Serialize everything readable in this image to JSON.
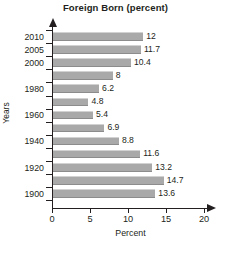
{
  "chart_data": {
    "type": "bar",
    "orientation": "horizontal",
    "title": "Foreign Born (percent)",
    "xlabel": "Percent",
    "ylabel": "Years",
    "xlim": [
      0,
      20
    ],
    "xticks": [
      0,
      5,
      10,
      15,
      20
    ],
    "xtick_labels": [
      "0",
      "5",
      "10",
      "15",
      "20"
    ],
    "grid": false,
    "legend": null,
    "bar_color": "#a9a9a9",
    "axis_color": "#231f20",
    "categories": [
      "2010",
      "2005",
      "2000",
      "",
      "1980",
      "",
      "1960",
      "",
      "1940",
      "",
      "1920",
      "",
      "1900"
    ],
    "values": [
      12,
      11.7,
      10.4,
      8,
      6.2,
      4.8,
      5.4,
      6.9,
      8.8,
      11.6,
      13.2,
      14.7,
      13.6
    ],
    "data_labels": [
      "12",
      "11.7",
      "10.4",
      "8",
      "6.2",
      "4.8",
      "5.4",
      "6.9",
      "8.8",
      "11.6",
      "13.2",
      "14.7",
      "13.6"
    ],
    "bars": [
      {
        "category": "2010",
        "value": 12,
        "label": "12"
      },
      {
        "category": "2005",
        "value": 11.7,
        "label": "11.7"
      },
      {
        "category": "2000",
        "value": 10.4,
        "label": "10.4"
      },
      {
        "category": "",
        "value": 8,
        "label": "8"
      },
      {
        "category": "1980",
        "value": 6.2,
        "label": "6.2"
      },
      {
        "category": "",
        "value": 4.8,
        "label": "4.8"
      },
      {
        "category": "1960",
        "value": 5.4,
        "label": "5.4"
      },
      {
        "category": "",
        "value": 6.9,
        "label": "6.9"
      },
      {
        "category": "1940",
        "value": 8.8,
        "label": "8.8"
      },
      {
        "category": "",
        "value": 11.6,
        "label": "11.6"
      },
      {
        "category": "1920",
        "value": 13.2,
        "label": "13.2"
      },
      {
        "category": "",
        "value": 14.7,
        "label": "14.7"
      },
      {
        "category": "1900",
        "value": 13.6,
        "label": "13.6"
      }
    ]
  }
}
